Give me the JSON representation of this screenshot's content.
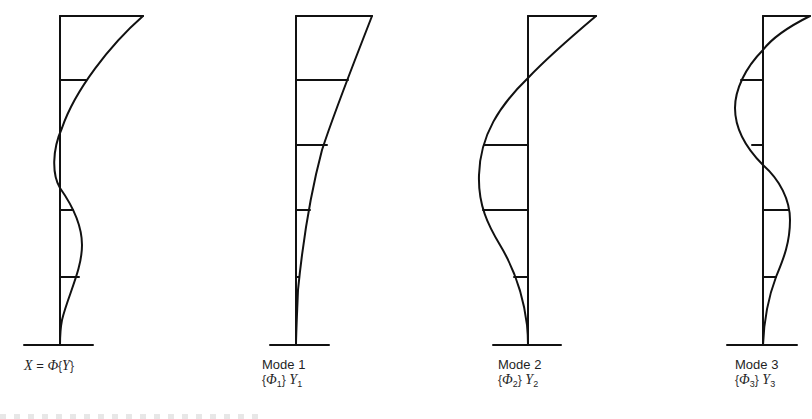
{
  "figure": {
    "panels": [
      {
        "id": "total",
        "label_line1": "X = Φ{Y}",
        "label_parts": {
          "lhs": "X",
          "eq": "=",
          "phi": "Φ",
          "open": "{",
          "var": "Y",
          "close": "}"
        }
      },
      {
        "id": "mode1",
        "label_line1": "Mode 1",
        "label_parts": {
          "open": "{",
          "phi": "Φ",
          "phi_sub": "1",
          "close": "}",
          "var": "Y",
          "var_sub": "1"
        }
      },
      {
        "id": "mode2",
        "label_line1": "Mode 2",
        "label_parts": {
          "open": "{",
          "phi": "Φ",
          "phi_sub": "2",
          "close": "}",
          "var": "Y",
          "var_sub": "2"
        }
      },
      {
        "id": "mode3",
        "label_line1": "Mode 3",
        "label_parts": {
          "open": "{",
          "phi": "Φ",
          "phi_sub": "3",
          "close": "}",
          "var": "Y",
          "var_sub": "3"
        }
      }
    ],
    "stroke_color": "#111111",
    "background": "#ffffff"
  }
}
